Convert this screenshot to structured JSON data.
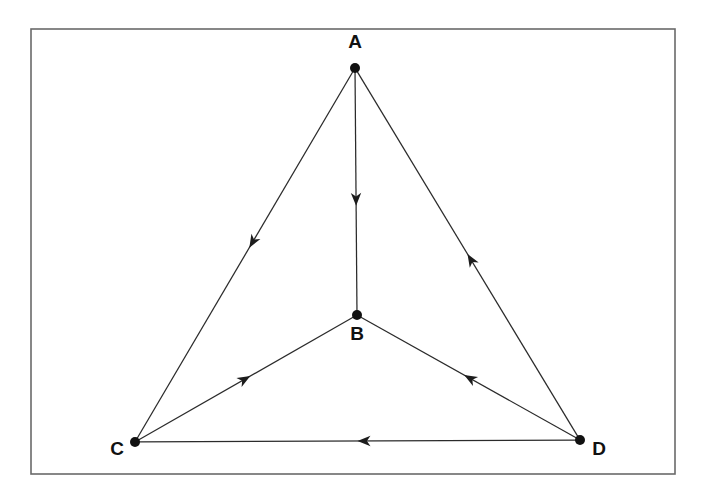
{
  "figure": {
    "background_color": "#ffffff",
    "frame": {
      "x": 31,
      "y": 29,
      "width": 644,
      "height": 445,
      "stroke_color": "#6a6a6a"
    }
  },
  "graph": {
    "type": "directed-graph",
    "node_color": "#111111",
    "edge_color": "#2b2b2b",
    "arrow_color": "#1c1c1c",
    "node_radius": 5,
    "nodes": [
      {
        "id": "A",
        "label": "A",
        "x": 355,
        "y": 68,
        "label_x": 355,
        "label_y": 48,
        "label_anchor": "middle"
      },
      {
        "id": "B",
        "label": "B",
        "x": 357,
        "y": 315,
        "label_x": 357,
        "label_y": 340,
        "label_anchor": "middle"
      },
      {
        "id": "C",
        "label": "C",
        "x": 135,
        "y": 442,
        "label_x": 117,
        "label_y": 455,
        "label_anchor": "middle"
      },
      {
        "id": "D",
        "label": "D",
        "x": 580,
        "y": 440,
        "label_x": 599,
        "label_y": 455,
        "label_anchor": "middle"
      }
    ],
    "edges": [
      {
        "id": "A-B",
        "from": "A",
        "to": "B",
        "arrow_t": 0.56,
        "label": "A to B"
      },
      {
        "id": "A-C",
        "from": "A",
        "to": "C",
        "arrow_t": 0.48,
        "label": "A to C"
      },
      {
        "id": "D-A",
        "from": "D",
        "to": "A",
        "arrow_t": 0.5,
        "label": "D to A"
      },
      {
        "id": "C-B",
        "from": "C",
        "to": "B",
        "arrow_t": 0.52,
        "label": "C to B"
      },
      {
        "id": "D-B",
        "from": "D",
        "to": "B",
        "arrow_t": 0.52,
        "label": "D to B"
      },
      {
        "id": "D-C",
        "from": "D",
        "to": "C",
        "arrow_t": 0.5,
        "label": "D to C"
      }
    ]
  }
}
